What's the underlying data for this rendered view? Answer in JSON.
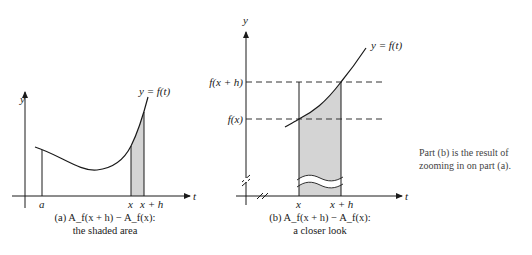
{
  "panel_a": {
    "y_axis_label": "y",
    "t_axis_label": "t",
    "curve_label": "y = f(t)",
    "tick_a": "a",
    "tick_x": "x",
    "tick_xh": "x + h",
    "caption_line1": "(a) A_f(x + h) − A_f(x):",
    "caption_line2": "the shaded area"
  },
  "panel_b": {
    "y_axis_label": "y",
    "t_axis_label": "t",
    "curve_label": "y = f(t)",
    "level_fxh": "f(x + h)",
    "level_fx": "f(x)",
    "tick_x": "x",
    "tick_xh": "x + h",
    "caption_line1": "(b) A_f(x + h) − A_f(x):",
    "caption_line2": "a closer look"
  },
  "side_note": "Part (b) is the result of zooming in on part (a).",
  "colors": {
    "shade": "#d4d4d4",
    "line": "#1a1a1a",
    "dash": "#333333"
  }
}
